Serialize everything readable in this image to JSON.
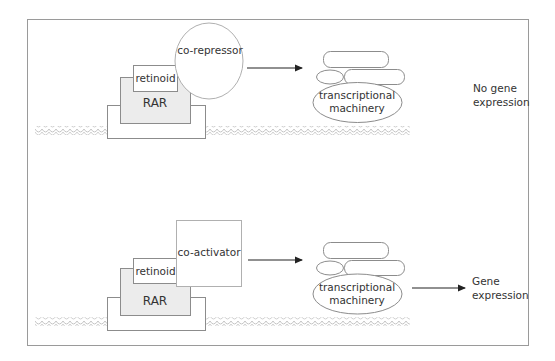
{
  "colors": {
    "frame": "#9a9a9a",
    "outline": "#8c8c8c",
    "rar_fill": "#ececec",
    "membrane": "#c4c4c4",
    "arrow": "#222222",
    "text": "#333333"
  },
  "panels": [
    {
      "id": "repressed",
      "retinoid_label": "retinoid",
      "receptor_label": "RAR",
      "cofactor_label": "co-repressor",
      "cofactor_shape": "circle",
      "machinery_label_line1": "transcriptional",
      "machinery_label_line2": "machinery",
      "outcome_line1": "No gene",
      "outcome_line2": "expression",
      "outcome_arrow": false
    },
    {
      "id": "activated",
      "retinoid_label": "retinoid",
      "receptor_label": "RAR",
      "cofactor_label": "co-activator",
      "cofactor_shape": "square",
      "machinery_label_line1": "transcriptional",
      "machinery_label_line2": "machinery",
      "outcome_line1": "Gene",
      "outcome_line2": "expression",
      "outcome_arrow": true
    }
  ]
}
